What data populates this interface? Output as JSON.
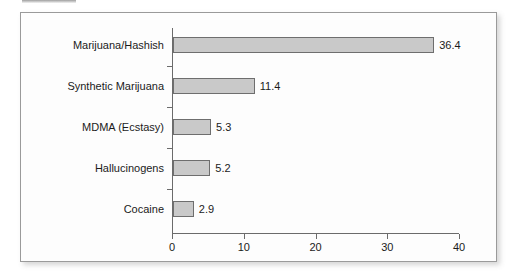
{
  "chart_data": {
    "type": "bar",
    "orientation": "horizontal",
    "title": "",
    "subtitle": "",
    "xlabel": "",
    "ylabel": "",
    "categories": [
      "Marijuana/Hashish",
      "Synthetic Marijuana",
      "MDMA (Ecstasy)",
      "Hallucinogens",
      "Cocaine"
    ],
    "values": [
      36.4,
      11.4,
      5.3,
      5.2,
      2.9
    ],
    "value_labels": [
      "36.4",
      "11.4",
      "5.3",
      "5.2",
      "2.9"
    ],
    "xlim": [
      0,
      40
    ],
    "xticks": [
      0,
      10,
      20,
      30,
      40
    ],
    "xtick_labels": [
      "0",
      "10",
      "20",
      "30",
      "40"
    ],
    "grid": false,
    "legend": null,
    "bar_fill_color": "#c9c9c9",
    "bar_edge_color": "#6e6e6e",
    "axis_color": "#6b6b6b",
    "text_color": "#1b1b1b",
    "panel_background": "#fdfdfd",
    "panel_border_color": "#9a9a9a"
  }
}
